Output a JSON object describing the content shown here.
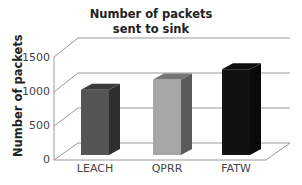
{
  "chart_data": {
    "type": "bar",
    "style": "3d-column",
    "title": "Number of packets sent to sink",
    "title_lines": [
      "Number of packets",
      "sent to sink"
    ],
    "xlabel": "",
    "ylabel": "Number of packets",
    "categories": [
      "LEACH",
      "QPRR",
      "FATW"
    ],
    "values": [
      950,
      1100,
      1250
    ],
    "values_are_estimates": true,
    "colors": [
      "#555555",
      "#a6a6a6",
      "#111111"
    ],
    "yticks": [
      "0",
      "500",
      "1000",
      "1500"
    ],
    "ylim": [
      0,
      1500
    ],
    "grid": true,
    "legend": "none"
  }
}
